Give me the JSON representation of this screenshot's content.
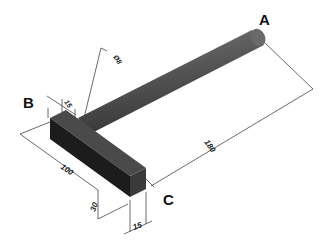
{
  "diagram": {
    "type": "isometric-technical-drawing",
    "points": {
      "A": "A",
      "B": "B",
      "C": "C"
    },
    "dimensions": {
      "rod_diameter": "Ø8",
      "block_offset": "15",
      "block_length": "100",
      "block_height": "30",
      "block_depth": "15",
      "rod_length": "180"
    },
    "colors": {
      "rod": "#555555",
      "block_front": "#1e1e1e",
      "block_top": "#4a4a4a",
      "block_side": "#3a3a3a",
      "dimension_lines": "#444444"
    }
  }
}
